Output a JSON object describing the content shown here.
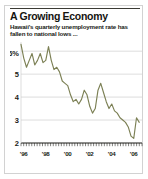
{
  "figure": {
    "title": "A Growing Economy",
    "subtitle": "Hawaii's quarterly unemployment rate has fallen to national lows ...",
    "line_color": "#7c8055",
    "grid_color": "#cfcfcf",
    "axis_color": "#1b1b16",
    "border_color": "#d2d2d2"
  },
  "chart_data": {
    "type": "line",
    "title": "A Growing Economy",
    "subtitle": "Hawaii's quarterly unemployment rate has fallen to national lows ...",
    "xlabel": "",
    "ylabel": "",
    "ylim": [
      2,
      6.4
    ],
    "xlim": [
      1995.75,
      2006.75
    ],
    "grid": true,
    "legend": false,
    "y_ticks": [
      2,
      3,
      4,
      5,
      6
    ],
    "y_tick_labels": [
      "2",
      "3",
      "4",
      "5",
      "6%"
    ],
    "x_ticks": [
      1996,
      1998,
      2000,
      2002,
      2004,
      2006
    ],
    "x_tick_labels": [
      "'96",
      "'98",
      "'00",
      "'02",
      "'04",
      "'06"
    ],
    "x_minor_tick_count": 45,
    "series": [
      {
        "name": "Hawaii quarterly unemployment rate",
        "x": [
          1995.75,
          1996.0,
          1996.25,
          1996.5,
          1996.75,
          1997.0,
          1997.25,
          1997.5,
          1997.75,
          1998.0,
          1998.25,
          1998.5,
          1998.75,
          1999.0,
          1999.25,
          1999.5,
          1999.75,
          2000.0,
          2000.25,
          2000.5,
          2000.75,
          2001.0,
          2001.25,
          2001.5,
          2001.75,
          2002.0,
          2002.25,
          2002.5,
          2002.75,
          2003.0,
          2003.25,
          2003.5,
          2003.75,
          2004.0,
          2004.25,
          2004.5,
          2004.75,
          2005.0,
          2005.25,
          2005.5,
          2005.75,
          2006.0,
          2006.25,
          2006.5
        ],
        "values": [
          6.3,
          5.7,
          5.3,
          5.6,
          5.9,
          5.4,
          5.6,
          5.9,
          5.5,
          5.6,
          6.2,
          5.6,
          5.2,
          5.3,
          5.1,
          4.7,
          4.6,
          4.5,
          4.1,
          3.8,
          3.9,
          3.7,
          3.9,
          4.3,
          4.1,
          3.6,
          3.3,
          3.5,
          4.3,
          4.6,
          4.2,
          3.8,
          3.5,
          3.7,
          3.4,
          3.3,
          3.1,
          3.0,
          2.9,
          2.7,
          2.3,
          2.2,
          3.1,
          2.9
        ]
      }
    ]
  }
}
